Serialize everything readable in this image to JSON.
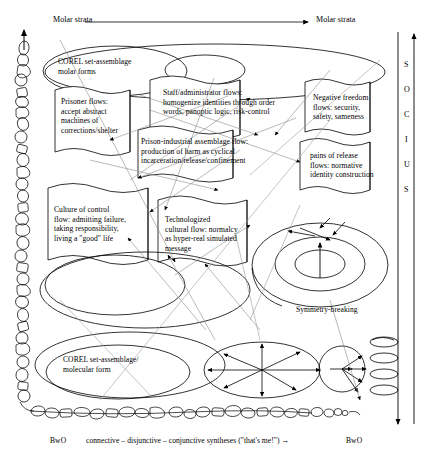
{
  "figure": {
    "title_top_left": "Molar strata",
    "title_top_right": "Molar strata",
    "vertical_axis_label": "SOCIUS",
    "vertical_axis_letters": [
      "S",
      "O",
      "C",
      "I",
      "U",
      "S"
    ],
    "bottom_left_label": "BwO",
    "bottom_right_label": "BwO",
    "bottom_caption": "connective – disjunctive – conjunctive syntheses (\"that's me!\") →",
    "symmetry_label": "Symmetry-breaking",
    "ink_color": "#000000",
    "thin_line_color": "#808080"
  },
  "boxes": {
    "corel_molar": "COREL set-assemblage\nmolar forms",
    "prisoner_flows": "Prisoner flows:\naccept abstract\nmachines of\ncorrections/shelter",
    "staff_flows": "Staff/administrator flows:\nhomogenize identities through order\nwords, panoptic logic, risk-control",
    "negative_freedom": "Negative freedom\nflows: security,\nsafety, sameness",
    "prison_industrial": "Prison-industrial assemblage flow:\nproduction of harm as cyclical\nincarceration/release/confinement",
    "pains_of_release": "pains of release\nflows: normative\nidentity construction",
    "culture_of_control": "Culture of control\nflow: admitting failure,\ntaking responsibility,\nliving a \"good\" life",
    "technologized": "Technologized\ncultural flow: normalcy\nas hyper-real  simulated\nmessage",
    "corel_molecular": "COREL set-assemblage/\nmolecular form"
  }
}
